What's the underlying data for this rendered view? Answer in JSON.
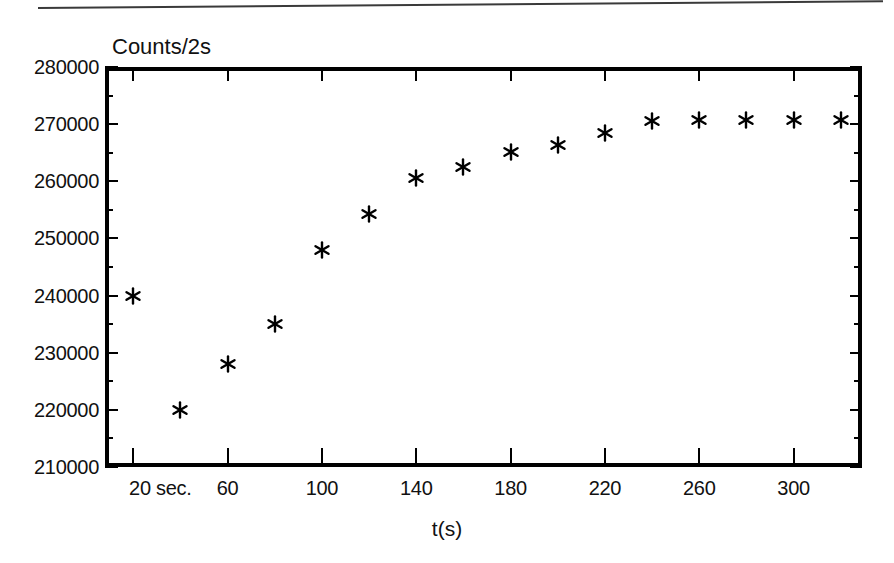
{
  "figure": {
    "name": "counts-vs-time-scatter",
    "axis_title_y": "Counts/2s",
    "axis_title_x": "t(s)",
    "first_x_label": "20 sec."
  },
  "chart_data": {
    "type": "scatter",
    "title": "",
    "subtitle": "",
    "xlabel": "t(s)",
    "ylabel": "Counts/2s",
    "xlim": [
      8,
      329
    ],
    "ylim": [
      210000,
      280000
    ],
    "grid": false,
    "legend": "none",
    "marker": "asterisk",
    "marker_color": "#000000",
    "x_major_ticks": [
      20,
      60,
      100,
      140,
      180,
      220,
      260,
      300
    ],
    "x_tick_labels": [
      "20 sec.",
      "60",
      "100",
      "140",
      "180",
      "220",
      "260",
      "300"
    ],
    "y_major_ticks": [
      210000,
      220000,
      230000,
      240000,
      250000,
      260000,
      270000,
      280000
    ],
    "y_tick_labels": [
      "210000",
      "220000",
      "230000",
      "240000",
      "250000",
      "260000",
      "270000",
      "280000"
    ],
    "y_minor_ticks": [
      215000,
      225000,
      235000,
      245000,
      255000,
      265000,
      275000
    ],
    "x": [
      20,
      40,
      60,
      80,
      100,
      120,
      140,
      160,
      180,
      200,
      220,
      240,
      260,
      280,
      300,
      320
    ],
    "y": [
      240000,
      220000,
      228000,
      235000,
      248000,
      254200,
      260500,
      262500,
      265200,
      266400,
      268500,
      270600,
      270700,
      270700,
      270700,
      270700
    ],
    "points": [
      {
        "x": 20,
        "y": 240000
      },
      {
        "x": 40,
        "y": 220000
      },
      {
        "x": 60,
        "y": 228000
      },
      {
        "x": 80,
        "y": 235000
      },
      {
        "x": 100,
        "y": 248000
      },
      {
        "x": 120,
        "y": 254200
      },
      {
        "x": 140,
        "y": 260500
      },
      {
        "x": 160,
        "y": 262500
      },
      {
        "x": 180,
        "y": 265200
      },
      {
        "x": 200,
        "y": 266400
      },
      {
        "x": 220,
        "y": 268500
      },
      {
        "x": 240,
        "y": 270600
      },
      {
        "x": 260,
        "y": 270700
      },
      {
        "x": 280,
        "y": 270700
      },
      {
        "x": 300,
        "y": 270700
      },
      {
        "x": 320,
        "y": 270700
      }
    ]
  }
}
